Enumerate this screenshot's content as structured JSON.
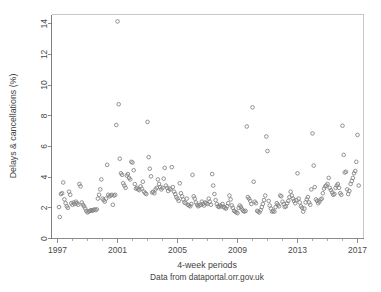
{
  "chart_data": {
    "type": "scatter",
    "title": "",
    "xlabel": "4-week periods",
    "ylabel": "Delays & cancellations (%)",
    "caption": "Data from dataportal.orr.gov.uk",
    "xlim": [
      1996.6,
      2017.4
    ],
    "ylim": [
      0,
      14.6
    ],
    "xticks": [
      1997,
      2001,
      2005,
      2009,
      2013,
      2017
    ],
    "xticklabels": [
      "1997",
      "2001",
      "2005",
      "2009",
      "2013",
      "2017"
    ],
    "xminorticks": [
      1998,
      1999,
      2000,
      2002,
      2003,
      2004,
      2006,
      2007,
      2008,
      2010,
      2011,
      2012,
      2014,
      2015,
      2016
    ],
    "yticks": [
      0,
      2,
      4,
      6,
      8,
      10,
      12,
      14
    ],
    "yticklabels": [
      "0",
      "2",
      "4",
      "6",
      "8",
      "10",
      "12",
      "14"
    ],
    "grid": false,
    "legend": null,
    "marker": "open-circle",
    "marker_color": "#808080",
    "marker_size": 3.6,
    "series": [
      {
        "name": "Delays & cancellations",
        "x": [
          1997.1,
          1997.15,
          1997.23,
          1997.31,
          1997.38,
          1997.46,
          1997.54,
          1997.62,
          1997.69,
          1997.77,
          1997.85,
          1997.92,
          1998.0,
          1998.08,
          1998.15,
          1998.23,
          1998.31,
          1998.38,
          1998.46,
          1998.54,
          1998.62,
          1998.69,
          1998.77,
          1998.85,
          1998.92,
          1999.0,
          1999.08,
          1999.15,
          1999.23,
          1999.31,
          1999.38,
          1999.46,
          1999.54,
          1999.62,
          1999.69,
          1999.77,
          1999.85,
          1999.92,
          2000.0,
          2000.08,
          2000.15,
          2000.23,
          2000.31,
          2000.38,
          2000.46,
          2000.54,
          2000.62,
          2000.69,
          2000.77,
          2000.85,
          2000.92,
          2001.0,
          2001.08,
          2001.15,
          2001.23,
          2001.31,
          2001.38,
          2001.46,
          2001.54,
          2001.62,
          2001.69,
          2001.77,
          2001.85,
          2001.92,
          2002.0,
          2002.08,
          2002.15,
          2002.23,
          2002.31,
          2002.38,
          2002.46,
          2002.54,
          2002.62,
          2002.69,
          2002.77,
          2002.85,
          2002.92,
          2003.0,
          2003.08,
          2003.15,
          2003.23,
          2003.31,
          2003.38,
          2003.46,
          2003.54,
          2003.62,
          2003.69,
          2003.77,
          2003.85,
          2003.92,
          2004.0,
          2004.08,
          2004.15,
          2004.23,
          2004.31,
          2004.38,
          2004.46,
          2004.54,
          2004.62,
          2004.69,
          2004.77,
          2004.85,
          2004.92,
          2005.0,
          2005.08,
          2005.15,
          2005.23,
          2005.31,
          2005.38,
          2005.46,
          2005.54,
          2005.62,
          2005.69,
          2005.77,
          2005.85,
          2005.92,
          2006.0,
          2006.08,
          2006.15,
          2006.23,
          2006.31,
          2006.38,
          2006.46,
          2006.54,
          2006.62,
          2006.69,
          2006.77,
          2006.85,
          2006.92,
          2007.0,
          2007.08,
          2007.15,
          2007.23,
          2007.31,
          2007.38,
          2007.46,
          2007.54,
          2007.62,
          2007.69,
          2007.77,
          2007.85,
          2007.92,
          2008.0,
          2008.08,
          2008.15,
          2008.23,
          2008.31,
          2008.38,
          2008.46,
          2008.54,
          2008.62,
          2008.69,
          2008.77,
          2008.85,
          2008.92,
          2009.0,
          2009.08,
          2009.15,
          2009.23,
          2009.31,
          2009.38,
          2009.46,
          2009.54,
          2009.62,
          2009.69,
          2009.77,
          2009.85,
          2009.92,
          2010.0,
          2010.08,
          2010.15,
          2010.23,
          2010.31,
          2010.38,
          2010.46,
          2010.54,
          2010.62,
          2010.69,
          2010.77,
          2010.85,
          2010.92,
          2011.0,
          2011.08,
          2011.15,
          2011.23,
          2011.31,
          2011.38,
          2011.46,
          2011.54,
          2011.62,
          2011.69,
          2011.77,
          2011.85,
          2011.92,
          2012.0,
          2012.08,
          2012.15,
          2012.23,
          2012.31,
          2012.38,
          2012.46,
          2012.54,
          2012.62,
          2012.69,
          2012.77,
          2012.85,
          2012.92,
          2013.0,
          2013.08,
          2013.15,
          2013.23,
          2013.31,
          2013.38,
          2013.46,
          2013.54,
          2013.62,
          2013.69,
          2013.77,
          2013.85,
          2013.92,
          2014.0,
          2014.08,
          2014.15,
          2014.23,
          2014.31,
          2014.38,
          2014.46,
          2014.54,
          2014.62,
          2014.69,
          2014.77,
          2014.85,
          2014.92,
          2015.0,
          2015.08,
          2015.15,
          2015.23,
          2015.31,
          2015.38,
          2015.46,
          2015.54,
          2015.62,
          2015.69,
          2015.77,
          2015.85,
          2015.92,
          2016.0,
          2016.08,
          2016.15,
          2016.23,
          2016.31,
          2016.38,
          2016.46,
          2016.54,
          2016.62,
          2016.69,
          2016.77,
          2016.85,
          2016.92,
          2017.0,
          2017.08
        ],
        "y": [
          2.05,
          1.4,
          2.9,
          2.95,
          3.65,
          2.55,
          2.3,
          2.1,
          2.0,
          3.05,
          2.85,
          2.3,
          2.2,
          2.35,
          2.25,
          2.4,
          2.3,
          2.2,
          3.55,
          3.4,
          2.35,
          2.2,
          2.1,
          1.95,
          1.8,
          1.7,
          1.75,
          1.8,
          1.85,
          1.8,
          1.85,
          1.9,
          1.85,
          1.9,
          2.6,
          2.85,
          3.2,
          3.85,
          2.6,
          2.5,
          2.4,
          2.6,
          4.8,
          2.85,
          2.75,
          2.8,
          2.85,
          2.2,
          2.8,
          2.85,
          7.4,
          14.15,
          8.75,
          5.2,
          4.25,
          4.15,
          3.6,
          3.45,
          3.3,
          4.1,
          4.2,
          3.95,
          3.85,
          5.0,
          4.95,
          4.45,
          3.55,
          3.25,
          3.3,
          3.2,
          3.15,
          3.4,
          3.25,
          3.7,
          3.05,
          2.95,
          2.9,
          7.6,
          5.3,
          4.55,
          4.05,
          3.0,
          3.05,
          2.95,
          3.2,
          3.3,
          3.85,
          3.55,
          3.35,
          3.2,
          3.3,
          3.9,
          4.6,
          3.45,
          3.3,
          3.1,
          3.25,
          3.2,
          4.65,
          3.35,
          3.05,
          2.9,
          2.7,
          2.6,
          2.45,
          3.6,
          2.95,
          2.75,
          2.55,
          2.35,
          2.3,
          2.6,
          2.2,
          2.15,
          2.1,
          2.25,
          4.15,
          2.75,
          2.6,
          2.35,
          2.2,
          2.1,
          2.15,
          2.2,
          2.4,
          2.25,
          2.15,
          2.35,
          2.3,
          2.25,
          2.6,
          2.4,
          2.2,
          4.2,
          3.45,
          2.9,
          2.5,
          2.25,
          2.1,
          2.05,
          2.15,
          2.1,
          2.25,
          2.05,
          2.0,
          1.95,
          2.1,
          2.3,
          2.8,
          2.55,
          2.15,
          2.0,
          1.8,
          1.75,
          1.7,
          1.65,
          2.0,
          2.15,
          2.05,
          1.9,
          1.8,
          1.75,
          1.8,
          7.3,
          2.7,
          2.6,
          2.45,
          2.25,
          8.55,
          3.7,
          2.4,
          2.3,
          1.8,
          1.75,
          1.7,
          1.85,
          2.05,
          2.25,
          2.5,
          2.8,
          6.65,
          5.7,
          2.45,
          2.15,
          1.95,
          1.75,
          1.8,
          1.75,
          2.05,
          2.3,
          2.2,
          2.1,
          2.8,
          2.75,
          2.4,
          2.25,
          2.05,
          2.1,
          2.3,
          2.45,
          2.7,
          3.05,
          2.8,
          2.6,
          2.45,
          2.3,
          2.5,
          4.25,
          2.6,
          2.35,
          2.1,
          2.0,
          1.75,
          1.95,
          2.35,
          2.55,
          2.7,
          2.35,
          2.2,
          3.2,
          6.85,
          4.75,
          3.35,
          2.55,
          2.45,
          2.3,
          2.4,
          2.55,
          2.6,
          2.95,
          3.25,
          3.4,
          3.45,
          3.55,
          3.95,
          3.3,
          3.15,
          3.0,
          2.85,
          2.9,
          3.3,
          3.45,
          3.55,
          3.3,
          2.95,
          2.85,
          7.35,
          5.45,
          4.3,
          4.35,
          3.2,
          2.9,
          3.1,
          3.55,
          3.75,
          3.95,
          4.25,
          4.4,
          5.0,
          6.75,
          3.45
        ]
      }
    ]
  },
  "axis": {
    "ylabel": "Delays & cancellations (%)",
    "xlabel": "4-week periods",
    "caption": "Data from dataportal.orr.gov.uk"
  }
}
